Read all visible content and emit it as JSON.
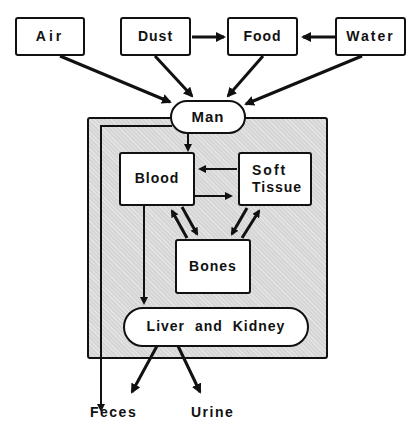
{
  "diagram": {
    "sources": [
      {
        "id": "air",
        "label": "Air"
      },
      {
        "id": "dust",
        "label": "Dust"
      },
      {
        "id": "food",
        "label": "Food"
      },
      {
        "id": "water",
        "label": "Water"
      }
    ],
    "man": {
      "label": "Man"
    },
    "compartments": {
      "blood": "Blood",
      "soft_tissue_line1": "Soft",
      "soft_tissue_line2": "Tissue",
      "bones": "Bones",
      "liver_kidney": "Liver and Kidney"
    },
    "outputs": {
      "feces": "Feces",
      "urine": "Urine"
    },
    "edges": [
      [
        "Dust",
        "Food"
      ],
      [
        "Water",
        "Food"
      ],
      [
        "Air",
        "Man"
      ],
      [
        "Dust",
        "Man"
      ],
      [
        "Food",
        "Man"
      ],
      [
        "Water",
        "Man"
      ],
      [
        "Man",
        "Blood"
      ],
      [
        "Man",
        "Feces"
      ],
      [
        "Soft Tissue",
        "Blood"
      ],
      [
        "Blood",
        "Soft Tissue"
      ],
      [
        "Blood",
        "Bones"
      ],
      [
        "Bones",
        "Blood"
      ],
      [
        "Soft Tissue",
        "Bones"
      ],
      [
        "Bones",
        "Soft Tissue"
      ],
      [
        "Blood",
        "Liver and Kidney"
      ],
      [
        "Liver and Kidney",
        "Feces"
      ],
      [
        "Liver and Kidney",
        "Urine"
      ]
    ],
    "colors": {
      "line": "#111111",
      "panel": "#d6d6d6",
      "box": "#ffffff"
    }
  }
}
